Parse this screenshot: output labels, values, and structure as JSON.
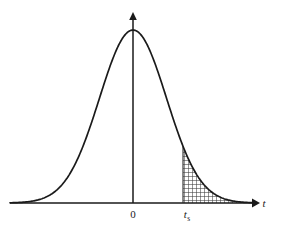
{
  "figure": {
    "title": "",
    "background_color": "#ffffff",
    "line_color": "#1a1a1a",
    "hatch_color": "#3c3c3c"
  },
  "labels": {
    "origin": "0",
    "threshold_symbol": "t",
    "threshold_subscript": "s",
    "x_axis": "t"
  },
  "chart_data": {
    "type": "line",
    "title": "",
    "xlabel": "t",
    "ylabel": "",
    "grid": false,
    "legend_position": "none",
    "curve_name": "standard normal density",
    "axis": {
      "x_axis_y_pixel": 203,
      "y_axis_x_pixel": 133,
      "x_arrow_tip_pixel": 258,
      "y_arrow_tip_pixel": 13
    },
    "annotations": [
      {
        "label": "0",
        "x_pixel": 133,
        "description": "origin tick label on t axis"
      },
      {
        "label": "t_s",
        "x_pixel": 190,
        "description": "critical value marking left edge of shaded tail"
      },
      {
        "label": "t",
        "x_pixel": 263,
        "description": "horizontal axis name"
      }
    ],
    "shaded_region": {
      "name": "right-tail-area",
      "fill": "cross-hatch",
      "x_start_pixel": 183,
      "x_end_pixel": 241
    },
    "x": [
      10,
      20,
      30,
      40,
      50,
      60,
      70,
      80,
      90,
      100,
      110,
      120,
      133,
      146,
      156,
      166,
      176,
      186,
      196,
      206,
      216,
      226,
      236,
      246,
      256
    ],
    "y": [
      202.4,
      201.8,
      200.6,
      198.2,
      193.8,
      186.4,
      175.2,
      160.2,
      141.4,
      120.4,
      99.2,
      80.4,
      30.0,
      80.4,
      99.2,
      120.4,
      141.4,
      160.2,
      175.2,
      186.4,
      193.8,
      198.2,
      200.6,
      201.8,
      202.4
    ],
    "curve_points": [
      [
        10,
        202.6
      ],
      [
        18,
        202.2
      ],
      [
        26,
        201.5
      ],
      [
        34,
        200.3
      ],
      [
        42,
        198.3
      ],
      [
        50,
        195.1
      ],
      [
        58,
        190.3
      ],
      [
        66,
        183.3
      ],
      [
        74,
        173.8
      ],
      [
        82,
        161.4
      ],
      [
        90,
        146.1
      ],
      [
        98,
        128.3
      ],
      [
        106,
        108.9
      ],
      [
        114,
        89.2
      ],
      [
        122,
        70.7
      ],
      [
        133,
        30.0
      ],
      [
        144,
        70.7
      ],
      [
        152,
        89.2
      ],
      [
        160,
        108.9
      ],
      [
        168,
        128.3
      ],
      [
        176,
        146.1
      ],
      [
        184,
        161.4
      ],
      [
        192,
        173.8
      ],
      [
        200,
        183.3
      ],
      [
        208,
        190.3
      ],
      [
        216,
        195.1
      ],
      [
        224,
        198.3
      ],
      [
        232,
        200.3
      ],
      [
        240,
        201.5
      ],
      [
        248,
        202.2
      ],
      [
        256,
        202.6
      ]
    ],
    "ylim": [
      0,
      233
    ],
    "xlim": [
      0,
      283
    ]
  }
}
